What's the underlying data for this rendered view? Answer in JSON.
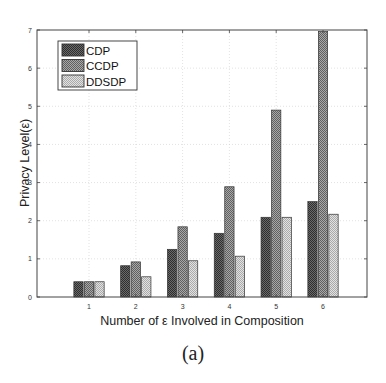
{
  "chart_data": {
    "type": "bar",
    "title": "",
    "xlabel": "Number of ε Involved in Composition",
    "ylabel": "Privacy Level(ε)",
    "categories": [
      "1",
      "2",
      "3",
      "4",
      "5",
      "6"
    ],
    "series": [
      {
        "name": "CDP",
        "color": "#555555",
        "values": [
          0.4,
          0.82,
          1.25,
          1.67,
          2.09,
          2.5
        ]
      },
      {
        "name": "CCDP",
        "color": "#8c8c8c",
        "values": [
          0.4,
          0.92,
          1.84,
          2.89,
          4.9,
          6.96
        ]
      },
      {
        "name": "DDSDP",
        "color": "#c8c8c8",
        "values": [
          0.4,
          0.53,
          0.95,
          1.07,
          2.09,
          2.17
        ]
      }
    ],
    "ylim": [
      0,
      7
    ],
    "yticks": [
      "0",
      "1",
      "2",
      "3",
      "4",
      "5",
      "6",
      "7"
    ],
    "grid": true,
    "legend_position": "upper left"
  },
  "caption": "(a)"
}
